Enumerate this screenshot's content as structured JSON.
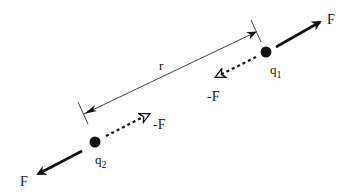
{
  "diagram": {
    "colors": {
      "ink": "#111111",
      "background": "#ffffff"
    },
    "charges": [
      {
        "id": "q1",
        "label": "q",
        "subscript": "1",
        "x": 266,
        "y": 52
      },
      {
        "id": "q2",
        "label": "q",
        "subscript": "2",
        "x": 95,
        "y": 142
      }
    ],
    "forces": [
      {
        "on": "q1",
        "label": "F",
        "style": "solid",
        "direction": "away"
      },
      {
        "on": "q1",
        "label": "-F",
        "style": "dashed",
        "direction": "toward"
      },
      {
        "on": "q2",
        "label": "F",
        "style": "solid",
        "direction": "away"
      },
      {
        "on": "q2",
        "label": "-F",
        "style": "dashed",
        "direction": "toward"
      }
    ],
    "distance": {
      "label": "r"
    }
  }
}
